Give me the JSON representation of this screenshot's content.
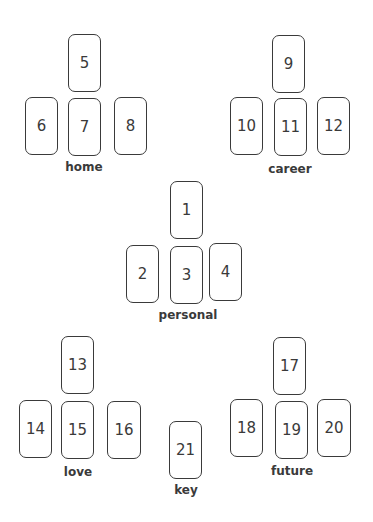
{
  "groups": [
    {
      "name": "home",
      "label": {
        "text": "home",
        "x": 84,
        "y": 160
      },
      "cards": [
        {
          "n": "5",
          "x": 68,
          "y": 34,
          "w": 33,
          "h": 58
        },
        {
          "n": "6",
          "x": 25,
          "y": 97,
          "w": 33,
          "h": 58
        },
        {
          "n": "7",
          "x": 68,
          "y": 98,
          "w": 33,
          "h": 58
        },
        {
          "n": "8",
          "x": 114,
          "y": 97,
          "w": 33,
          "h": 58
        }
      ]
    },
    {
      "name": "career",
      "label": {
        "text": "career",
        "x": 290,
        "y": 162
      },
      "cards": [
        {
          "n": "9",
          "x": 272,
          "y": 35,
          "w": 33,
          "h": 58
        },
        {
          "n": "10",
          "x": 230,
          "y": 97,
          "w": 33,
          "h": 58
        },
        {
          "n": "11",
          "x": 274,
          "y": 98,
          "w": 33,
          "h": 58
        },
        {
          "n": "12",
          "x": 317,
          "y": 97,
          "w": 33,
          "h": 58
        }
      ]
    },
    {
      "name": "personal",
      "label": {
        "text": "personal",
        "x": 188,
        "y": 308
      },
      "cards": [
        {
          "n": "1",
          "x": 170,
          "y": 181,
          "w": 33,
          "h": 58
        },
        {
          "n": "2",
          "x": 126,
          "y": 245,
          "w": 33,
          "h": 58
        },
        {
          "n": "3",
          "x": 170,
          "y": 246,
          "w": 33,
          "h": 58
        },
        {
          "n": "4",
          "x": 209,
          "y": 243,
          "w": 33,
          "h": 58
        }
      ]
    },
    {
      "name": "love",
      "label": {
        "text": "love",
        "x": 78,
        "y": 465
      },
      "cards": [
        {
          "n": "13",
          "x": 61,
          "y": 336,
          "w": 33,
          "h": 58
        },
        {
          "n": "14",
          "x": 19,
          "y": 400,
          "w": 33,
          "h": 58
        },
        {
          "n": "15",
          "x": 61,
          "y": 401,
          "w": 33,
          "h": 58
        },
        {
          "n": "16",
          "x": 107,
          "y": 401,
          "w": 34,
          "h": 58
        }
      ]
    },
    {
      "name": "future",
      "label": {
        "text": "future",
        "x": 292,
        "y": 464
      },
      "cards": [
        {
          "n": "17",
          "x": 273,
          "y": 337,
          "w": 33,
          "h": 58
        },
        {
          "n": "18",
          "x": 230,
          "y": 399,
          "w": 33,
          "h": 58
        },
        {
          "n": "19",
          "x": 275,
          "y": 401,
          "w": 33,
          "h": 58
        },
        {
          "n": "20",
          "x": 317,
          "y": 399,
          "w": 34,
          "h": 58
        }
      ]
    },
    {
      "name": "key",
      "label": {
        "text": "key",
        "x": 186,
        "y": 483
      },
      "cards": [
        {
          "n": "21",
          "x": 169,
          "y": 421,
          "w": 33,
          "h": 58
        }
      ]
    }
  ]
}
